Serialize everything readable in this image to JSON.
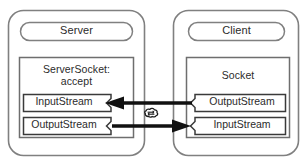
{
  "diagram": {
    "title_semantics": "java-socket-client-server-communication",
    "colors": {
      "outer_border": "#808080",
      "inner_border": "#6e6e6e",
      "stream_border": "#3a3a3a",
      "arrow": "#111111",
      "text": "#2b2b2b",
      "background": "#ffffff"
    },
    "server": {
      "host_label": "Server",
      "socket_label_line1": "ServerSocket:",
      "socket_label_line2": "accept",
      "streams": [
        {
          "label": "InputStream",
          "notch_side": "right"
        },
        {
          "label": "OutputStream",
          "notch_side": "right"
        }
      ]
    },
    "client": {
      "host_label": "Client",
      "socket_label": "Socket",
      "streams": [
        {
          "label": "OutputStream",
          "notch_side": "left"
        },
        {
          "label": "InputStream",
          "notch_side": "left"
        }
      ]
    },
    "network": {
      "icon": "cloud-icon",
      "label": ""
    },
    "arrows": [
      {
        "name": "client-output-to-server-input",
        "direction": "left",
        "from": "Client.OutputStream",
        "to": "Server.InputStream"
      },
      {
        "name": "server-output-to-client-input",
        "direction": "right",
        "from": "Server.OutputStream",
        "to": "Client.InputStream"
      }
    ]
  }
}
